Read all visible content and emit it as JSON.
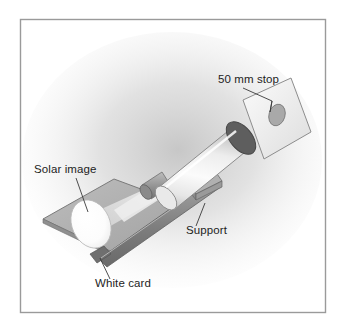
{
  "figure": {
    "frame": {
      "present": true,
      "color": "#9a9a9a",
      "x": 20,
      "y": 19,
      "width": 306,
      "height": 294
    },
    "background": {
      "color": "#ffffff",
      "shadow_color": "#c9c9c9"
    }
  },
  "labels": [
    {
      "id": "stop",
      "text": "50 mm stop",
      "x": 218,
      "y": 83,
      "anchor": "start"
    },
    {
      "id": "solar_image",
      "text": "Solar image",
      "x": 34,
      "y": 173,
      "anchor": "start"
    },
    {
      "id": "support",
      "text": "Support",
      "x": 186,
      "y": 234,
      "anchor": "start"
    },
    {
      "id": "white_card",
      "text": "White card",
      "x": 95,
      "y": 287,
      "anchor": "start"
    }
  ],
  "parts": {
    "stop_card": {
      "name": "50 mm stop card",
      "fill": "#f2f2f2",
      "stroke": "#8d8d8d"
    },
    "stop_hole": {
      "name": "50 mm aperture hole",
      "fill": "#a9a9a9",
      "stroke": "#7d7d7d"
    },
    "tube": {
      "name": "telescope tube",
      "fill": "#f4f4f4",
      "stroke": "#8c8c8c"
    },
    "tube_opening": {
      "name": "tube objective opening",
      "fill": "#5e5e5e",
      "stroke": "#4a4a4a"
    },
    "eyepiece": {
      "name": "eyepiece barrel",
      "fill": "#9b9b9b",
      "stroke": "#6f6f6f"
    },
    "support": {
      "name": "support rail",
      "fill": "#888888",
      "stroke": "#5f5f5f"
    },
    "support_block": {
      "name": "tube mounting block",
      "fill": "#9e9e9e",
      "stroke": "#6b6b6b"
    },
    "white_card": {
      "name": "white projection card",
      "fill": "#b2b2b2",
      "stroke": "#7a7a7a"
    },
    "solar_image": {
      "name": "projected solar image",
      "fill": "#fdfdfd",
      "stroke": "#b9b9b9"
    },
    "light_cone": {
      "name": "projected light cone",
      "fill": "#e2e2e2"
    },
    "leader_lines": {
      "name": "label leader lines",
      "stroke": "#3a3a3a"
    }
  },
  "colors": {
    "ink": "#1d1d1d",
    "frame": "#9a9a9a",
    "light": "#f4f4f4",
    "mid": "#b2b2b2",
    "dark": "#5e5e5e"
  }
}
